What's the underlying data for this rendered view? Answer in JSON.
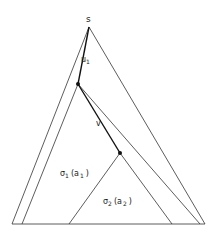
{
  "diagram": {
    "labels": {
      "root": "s",
      "edge1": "u",
      "edge1_sub": "1",
      "edge2": "v",
      "sub1_sigma": "σ",
      "sub1_sigma_sub": "1",
      "sub1_arg": "(a",
      "sub1_arg_sub": "1",
      "sub1_close": ")",
      "sub2_sigma": "σ",
      "sub2_sigma_sub": "2",
      "sub2_arg": "(a",
      "sub2_arg_sub": "2",
      "sub2_close": ")"
    },
    "line_color": "#333333",
    "node_color": "#111111"
  }
}
